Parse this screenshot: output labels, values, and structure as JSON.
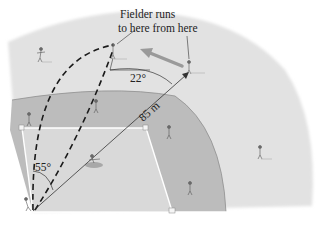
{
  "figure": {
    "callout_line1": "Fielder runs",
    "callout_line2": "to here from here",
    "angle_launch": "55°",
    "angle_fielder": "22°",
    "distance": "85 m"
  },
  "colors": {
    "outfield": "#e4e4e4",
    "infield_dirt": "#bdbdbd",
    "infield_grass": "#dcdcdc",
    "lines": "#ffffff",
    "ink": "#222222",
    "run_arrow": "#9a9a9a"
  }
}
